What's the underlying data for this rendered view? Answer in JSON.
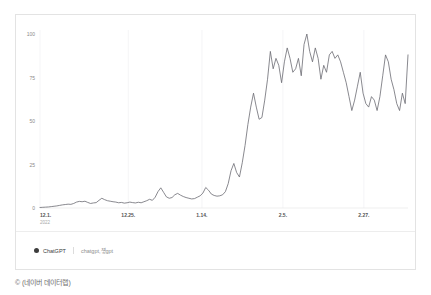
{
  "credit": "© (네이버 데이터랩)",
  "legend": {
    "series_label": "ChatGPT",
    "keyword_label": "chatgpt,첗gpt",
    "dot_color": "#3d3d3d"
  },
  "chart_data": {
    "type": "line",
    "title": "",
    "subtitle": "",
    "xlabel": "",
    "ylabel": "",
    "ylim": [
      0,
      100
    ],
    "yticks": [
      0,
      25,
      50,
      75,
      100
    ],
    "ytick_labels": [
      "0",
      "25",
      "50",
      "75",
      "100"
    ],
    "grid": "vertical-faint",
    "legend_position": "bottom-left",
    "line_color": "#6b6b72",
    "line_width": 0.8,
    "xtick_labels": [
      "12.1.",
      "12.25.",
      "1.14.",
      "2.5.",
      "2.27."
    ],
    "xtick_sublabels": [
      "2022",
      "",
      "",
      "",
      ""
    ],
    "xtick_positions": [
      0,
      24,
      44,
      66,
      88
    ],
    "x_count": 100,
    "series": [
      {
        "name": "ChatGPT",
        "keyword": "chatgpt,첗gpt",
        "values": [
          0.3,
          0.4,
          0.5,
          0.6,
          0.8,
          1.0,
          1.2,
          1.5,
          1.8,
          2.0,
          2.2,
          2.1,
          2.6,
          3.4,
          3.8,
          3.6,
          3.9,
          3.2,
          2.6,
          2.9,
          3.1,
          4.4,
          5.6,
          4.8,
          4.2,
          3.9,
          3.6,
          3.4,
          3.0,
          3.2,
          2.8,
          3.0,
          3.4,
          3.1,
          2.9,
          3.3,
          3.0,
          3.6,
          4.2,
          5.0,
          4.4,
          6.2,
          9.4,
          11.6,
          9.0,
          6.4,
          5.6,
          6.0,
          7.6,
          8.4,
          7.4,
          6.6,
          6.0,
          5.6,
          5.2,
          5.4,
          6.2,
          7.0,
          8.6,
          11.8,
          10.2,
          8.0,
          7.2,
          6.8,
          7.0,
          7.6,
          9.4,
          14.0,
          21.4,
          25.6,
          20.4,
          17.8,
          26.0,
          36.0,
          48.0,
          58.0,
          66.0,
          58.0,
          51.0,
          52.0,
          62.0,
          74.0,
          90.0,
          80.0,
          86.0,
          82.0,
          72.0,
          84.0,
          92.0,
          86.0,
          78.0,
          80.0,
          86.0,
          76.0,
          94.0,
          100.0,
          90.0,
          84.0,
          92.0,
          86.0,
          74.0,
          82.0,
          78.0,
          88.0,
          90.0,
          86.0,
          88.0,
          84.0,
          78.0,
          72.0,
          64.0,
          56.0,
          62.0,
          70.0,
          78.0,
          66.0,
          60.0,
          58.0,
          64.0,
          62.0,
          56.0,
          64.0,
          76.0,
          88.0,
          84.0,
          74.0,
          68.0,
          60.0,
          56.0,
          66.0,
          60.0,
          88.0
        ]
      }
    ]
  }
}
